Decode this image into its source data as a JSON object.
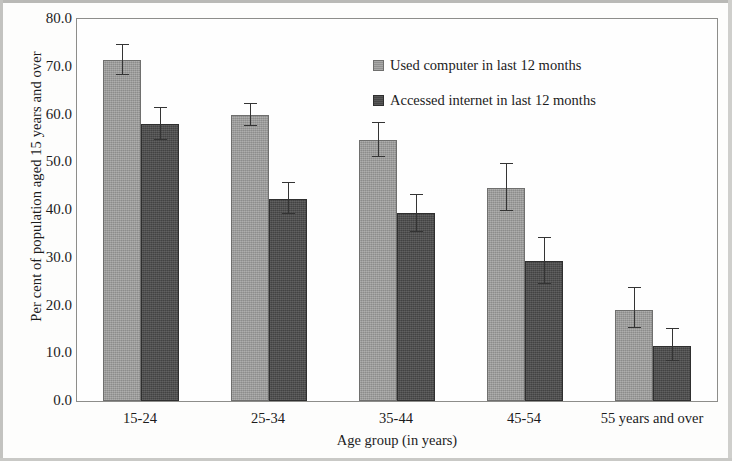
{
  "chart_data": {
    "type": "bar",
    "title": "",
    "xlabel": "Age group (in years)",
    "ylabel": "Per cent of population aged 15 years and over",
    "categories": [
      "15-24",
      "25-34",
      "35-44",
      "45-54",
      "55 years and over"
    ],
    "ylim": [
      0.0,
      80.0
    ],
    "ytick_labels": [
      "0.0",
      "10.0",
      "20.0",
      "30.0",
      "40.0",
      "50.0",
      "60.0",
      "70.0",
      "80.0"
    ],
    "ytick_values": [
      0.0,
      10.0,
      20.0,
      30.0,
      40.0,
      50.0,
      60.0,
      70.0,
      80.0
    ],
    "grid": false,
    "legend_position": "inside-top-center",
    "error_bars": true,
    "series": [
      {
        "name": "Used computer in last 12 months",
        "color": "#9d9d9c",
        "values": [
          71.5,
          59.8,
          54.7,
          44.7,
          19.1
        ],
        "err_low": [
          68.3,
          57.5,
          51.0,
          39.8,
          15.2
        ],
        "err_high": [
          74.6,
          62.1,
          58.2,
          49.6,
          23.7
        ]
      },
      {
        "name": "Accessed internet in last 12 months",
        "color": "#4c4c4c",
        "values": [
          58.0,
          42.3,
          39.3,
          29.4,
          11.6
        ],
        "err_low": [
          54.6,
          39.2,
          35.4,
          24.6,
          8.3
        ],
        "err_high": [
          61.4,
          45.6,
          43.1,
          34.2,
          15.0
        ]
      }
    ]
  },
  "legend": {
    "items": [
      {
        "label": "Used computer in last 12 months",
        "swatch": "light"
      },
      {
        "label": "Accessed internet in last 12 months",
        "swatch": "dark"
      }
    ]
  },
  "axes": {
    "y_title": "Per cent of population aged 15 years and over",
    "x_title": "Age group (in years)"
  }
}
